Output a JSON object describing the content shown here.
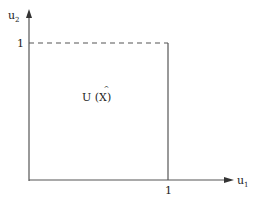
{
  "diagram": {
    "axes": {
      "x_label": "u",
      "x_subscript": "1",
      "y_label": "u",
      "y_subscript": "2"
    },
    "ticks": {
      "x_tick": "1",
      "y_tick": "1"
    },
    "region": {
      "label_prefix": "U (",
      "label_var": "X",
      "label_accent": "^",
      "label_suffix": ")"
    },
    "colors": {
      "line": "#555555",
      "text": "#222222",
      "background": "#ffffff"
    }
  }
}
